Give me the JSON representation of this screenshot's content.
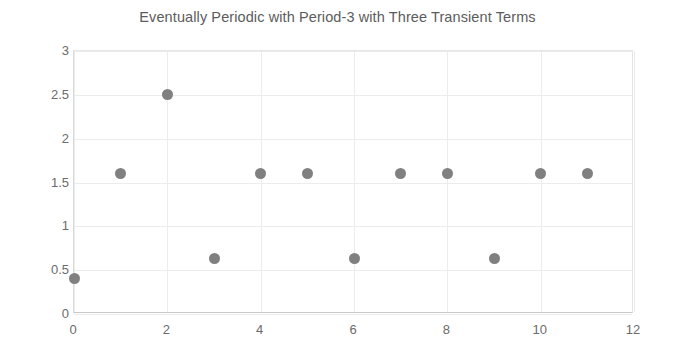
{
  "chart_data": {
    "type": "scatter",
    "title": "Eventually Periodic with Period-3 with Three Transient Terms",
    "xlabel": "",
    "ylabel": "",
    "x": [
      0,
      1,
      2,
      3,
      4,
      5,
      6,
      7,
      8,
      9,
      10,
      11
    ],
    "values": [
      0.4,
      1.6,
      2.5,
      0.63,
      1.6,
      1.6,
      0.63,
      1.6,
      1.6,
      0.63,
      1.6,
      1.6
    ],
    "series": [
      {
        "name": "sequence",
        "points": [
          {
            "x": 0,
            "y": 0.4
          },
          {
            "x": 1,
            "y": 1.6
          },
          {
            "x": 2,
            "y": 2.5
          },
          {
            "x": 3,
            "y": 0.63
          },
          {
            "x": 4,
            "y": 1.6
          },
          {
            "x": 5,
            "y": 1.6
          },
          {
            "x": 6,
            "y": 0.63
          },
          {
            "x": 7,
            "y": 1.6
          },
          {
            "x": 8,
            "y": 1.6
          },
          {
            "x": 9,
            "y": 0.63
          },
          {
            "x": 10,
            "y": 1.6
          },
          {
            "x": 11,
            "y": 1.6
          }
        ],
        "marker_color": "#808080"
      }
    ],
    "xlim": [
      0,
      12
    ],
    "ylim": [
      0,
      3
    ],
    "xticks": [
      0,
      2,
      4,
      6,
      8,
      10,
      12
    ],
    "xtick_labels": [
      "0",
      "2",
      "4",
      "6",
      "8",
      "10",
      "12"
    ],
    "yticks": [
      0,
      0.5,
      1,
      1.5,
      2,
      2.5,
      3
    ],
    "ytick_labels": [
      "0",
      "0.5",
      "1",
      "1.5",
      "2",
      "2.5",
      "3"
    ],
    "grid": true,
    "grid_color": "#ececec",
    "legend": false,
    "background": "#ffffff",
    "title_color": "#5c5c5c",
    "tick_color": "#6b6b6b"
  }
}
